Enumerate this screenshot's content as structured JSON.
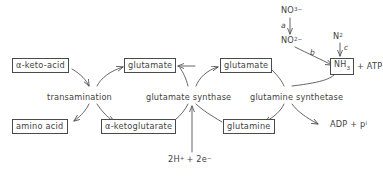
{
  "diagram": {
    "stroke_color": "#4a4a4a",
    "text_color": "#3f3f3f",
    "background": "#ffffff",
    "nodes": {
      "keto_acid": "α-keto-acid",
      "amino_acid": "amino acid",
      "ketoglutarate": "α-ketoglutarate",
      "glutamate_left": "glutamate",
      "glutamate_right": "glutamate",
      "glutamine": "glutamine",
      "ammonia": "NH",
      "ammonia_sub": "3",
      "nitrate": "NO",
      "nitrate_sub": "3",
      "nitrate_sup": "−",
      "nitrite": "NO",
      "nitrite_sub": "2",
      "nitrite_sup": "−",
      "dinitrogen": "N",
      "dinitrogen_sub": "2"
    },
    "enzymes": {
      "transamination": "transamination",
      "glutamate_synthase": "glutamate synthase",
      "glutamine_synthetase": "glutamine synthetase"
    },
    "step_labels": {
      "a": "a",
      "b": "b",
      "c": "c"
    },
    "cofactors": {
      "atp_tail": "+ ATP",
      "adp_phosphate": "ADP + p",
      "adp_phosphate_sub": "i",
      "reductant_prefix": "2H",
      "reductant_sup": "+",
      "reductant_middle": "+ 2e",
      "reductant_sup2": "−"
    }
  }
}
